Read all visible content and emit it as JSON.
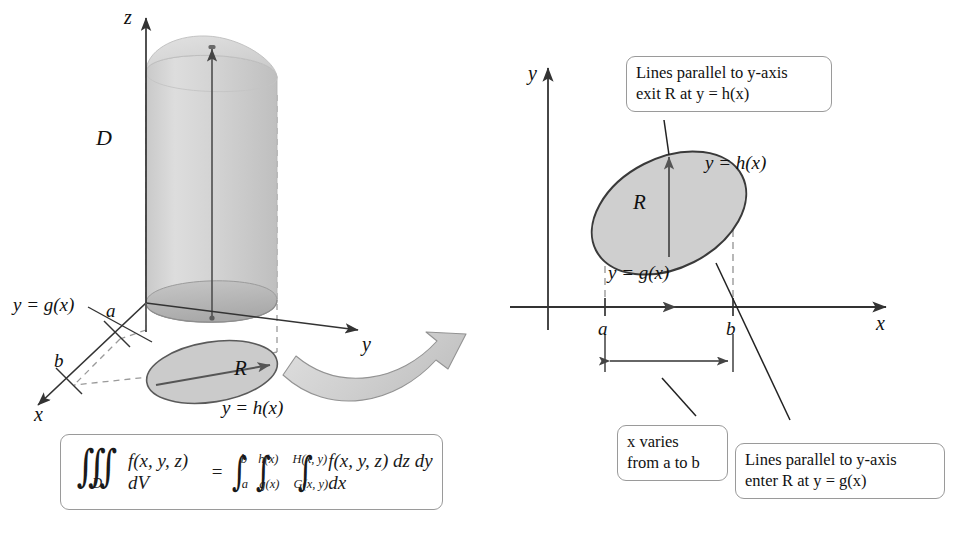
{
  "figure": {
    "colors": {
      "ink": "#111111",
      "rule": "#444444",
      "dashed": "#9a9a9a",
      "region_fill": "#cfcfcf",
      "region_stroke": "#4a4a4a",
      "solid_fill": "#d6d6d6",
      "solid_top": "#dcdcdc",
      "solid_base": "#bdbdbd",
      "ribbon_fill": "#d3d3d3",
      "ribbon_stroke": "#8a8a8a",
      "callout_border": "#9a9a9a",
      "callout_bg": "#ffffff"
    }
  },
  "left_panel": {
    "name": "3D solid region",
    "axes": [
      {
        "id": "z",
        "label": "z"
      },
      {
        "id": "y",
        "label": "y"
      },
      {
        "id": "x",
        "label": "x"
      }
    ],
    "solid_label": "D",
    "base_region_label": "R",
    "curve_upper_label": "y = h(x)",
    "curve_lower_label": "y = g(x)",
    "tick_a": "a",
    "tick_b": "b"
  },
  "right_panel": {
    "name": "2D projection region R in the xy-plane",
    "axis_y_label": "y",
    "axis_x_label": "x",
    "region_label": "R",
    "curve_upper_label": "y = h(x)",
    "curve_lower_label": "y = g(x)",
    "tick_a": "a",
    "tick_b": "b",
    "callouts": [
      {
        "id": "exit",
        "line1": "Lines parallel to y-axis",
        "line2": "exit R at y = h(x)"
      },
      {
        "id": "x-varies",
        "line1": "x varies",
        "line2": "from a to b"
      },
      {
        "id": "enter",
        "line1": "Lines parallel to y-axis",
        "line2": "enter R at y = g(x)"
      }
    ]
  },
  "formula": {
    "lhs": {
      "integral_glyph": "∭",
      "subscript": "D",
      "integrand": "f(x, y, z) dV"
    },
    "equals": "=",
    "rhs": {
      "limits": [
        {
          "upper": "b",
          "lower": "a"
        },
        {
          "upper": "h(x)",
          "lower": "g(x)"
        },
        {
          "upper": "H(x, y)",
          "lower": "G(x, y)"
        }
      ],
      "integrand": "f(x, y, z) dz dy dx"
    },
    "plain_text": "∭_D f(x, y, z) dV = ∫_a^b ∫_g(x)^h(x) ∫_G(x,y)^H(x,y) f(x, y, z) dz dy dx"
  }
}
